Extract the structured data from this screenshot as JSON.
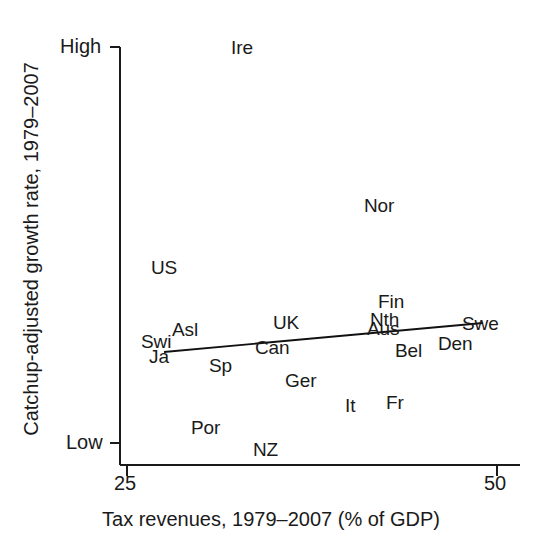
{
  "chart_data": {
    "type": "scatter",
    "title": "",
    "xlabel": "Tax revenues, 1979–2007 (% of GDP)",
    "ylabel": "Catchup-adjusted growth rate, 1979–2007",
    "xlim": [
      25,
      50
    ],
    "ylim": [
      0,
      100
    ],
    "xticks": [
      "25",
      "50"
    ],
    "yticks": [
      "High",
      "Low"
    ],
    "grid": false,
    "legend": null,
    "marker_style": "text-label-only",
    "points": [
      {
        "label": "Ire",
        "x": 32.5,
        "y": 98,
        "px": 231,
        "py": 38
      },
      {
        "label": "Nor",
        "x": 41.8,
        "y": 62,
        "px": 364,
        "py": 196
      },
      {
        "label": "US",
        "x": 28.0,
        "y": 48,
        "px": 151,
        "py": 258
      },
      {
        "label": "Fin",
        "x": 42.8,
        "y": 37,
        "px": 378,
        "py": 292
      },
      {
        "label": "Nth",
        "x": 42.3,
        "y": 31,
        "px": 370,
        "py": 310
      },
      {
        "label": "Aus",
        "x": 42.1,
        "y": 28,
        "px": 367,
        "py": 319
      },
      {
        "label": "UK",
        "x": 36.0,
        "y": 29,
        "px": 273,
        "py": 313
      },
      {
        "label": "Swe",
        "x": 48.0,
        "y": 28,
        "px": 462,
        "py": 314
      },
      {
        "label": "Asl",
        "x": 29.2,
        "y": 26,
        "px": 172,
        "py": 320
      },
      {
        "label": "Swi",
        "x": 27.3,
        "y": 22,
        "px": 141,
        "py": 332
      },
      {
        "label": "Den",
        "x": 46.2,
        "y": 22,
        "px": 438,
        "py": 334
      },
      {
        "label": "Can",
        "x": 34.8,
        "y": 20,
        "px": 255,
        "py": 338
      },
      {
        "label": "Bel",
        "x": 43.8,
        "y": 19,
        "px": 395,
        "py": 341
      },
      {
        "label": "Ja",
        "x": 27.8,
        "y": 17,
        "px": 149,
        "py": 347
      },
      {
        "label": "Sp",
        "x": 31.2,
        "y": 14,
        "px": 209,
        "py": 356
      },
      {
        "label": "Ger",
        "x": 36.5,
        "y": 11,
        "px": 285,
        "py": 371
      },
      {
        "label": "It",
        "x": 40.4,
        "y": 6,
        "px": 345,
        "py": 396
      },
      {
        "label": "Fr",
        "x": 43.2,
        "y": 6,
        "px": 386,
        "py": 393
      },
      {
        "label": "Por",
        "x": 30.3,
        "y": 2,
        "px": 191,
        "py": 418
      },
      {
        "label": "NZ",
        "x": 33.3,
        "y": 0,
        "px": 253,
        "py": 440
      }
    ],
    "trendline": {
      "type": "linear-fit",
      "x_start": 25.8,
      "x_end": 48.6,
      "y_start": 18,
      "y_end": 27,
      "px_start": 164,
      "py_start": 352,
      "px_end": 483,
      "py_end": 323,
      "slope_direction": "positive"
    },
    "axes_pixels": {
      "y_axis_x": 120,
      "x_axis_y": 465,
      "y_high_tick_py": 47,
      "y_low_tick_py": 443,
      "x_25_tick_px": 127,
      "x_50_tick_px": 497
    },
    "colors": {
      "axis": "#1a1a1a",
      "text": "#1a1a1a",
      "trendline": "#111111",
      "background": "#ffffff"
    }
  }
}
